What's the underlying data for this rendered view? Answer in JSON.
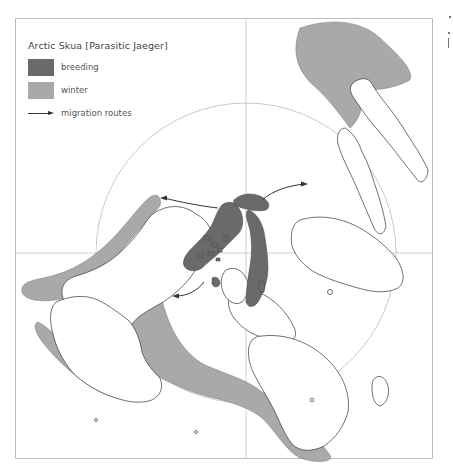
{
  "legend": {
    "title": "Arctic Skua [Parasitic Jaeger]",
    "items": [
      {
        "label": "breeding",
        "color": "#6a6a6a",
        "icon": "breeding-swatch"
      },
      {
        "label": "winter",
        "color": "#a9a9a9",
        "icon": "winter-swatch"
      },
      {
        "label": "migration routes",
        "color": "#333333",
        "icon": "arrow-icon"
      }
    ]
  },
  "map": {
    "projection": "polar azimuthal",
    "frame_color": "#bdbdbd",
    "gridline_color": "#c4c4c4",
    "coastline_color": "#333333",
    "land_color": "#ffffff",
    "breeding_color": "#6a6a6a",
    "winter_color": "#a9a9a9"
  }
}
